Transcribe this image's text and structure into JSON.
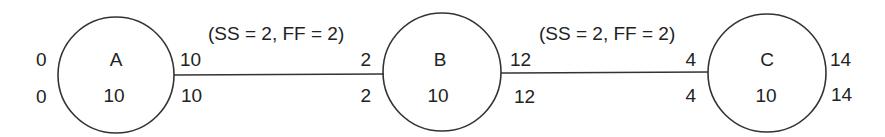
{
  "diagram": {
    "type": "precedence-network",
    "line_color": "#333333",
    "text_color": "#222222",
    "nodes": [
      {
        "id": "A",
        "label": "A",
        "duration": "10",
        "early_start": "0",
        "late_start": "0",
        "early_finish": "10",
        "late_finish": "10"
      },
      {
        "id": "B",
        "label": "B",
        "duration": "10",
        "early_start": "2",
        "late_start": "2",
        "early_finish": "12",
        "late_finish": "12"
      },
      {
        "id": "C",
        "label": "C",
        "duration": "10",
        "early_start": "4",
        "late_start": "4",
        "early_finish": "14",
        "late_finish": "14"
      }
    ],
    "edges": [
      {
        "from": "A",
        "to": "B",
        "label": "(SS = 2, FF = 2)"
      },
      {
        "from": "B",
        "to": "C",
        "label": "(SS = 2, FF = 2)"
      }
    ]
  }
}
